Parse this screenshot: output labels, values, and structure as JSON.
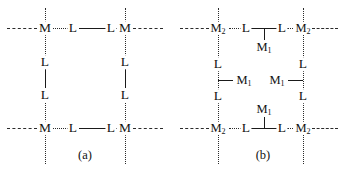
{
  "figure": {
    "name": "coordination-polymer-lattice-schemes",
    "panels": [
      {
        "id": "a",
        "caption": "(a)",
        "description": "Square grid lattice of M nodes bridged by L-L linkers",
        "node_label": "M",
        "linker_label": "L",
        "nodes": [
          {
            "label": "M",
            "position": "top-left"
          },
          {
            "label": "M",
            "position": "top-right"
          },
          {
            "label": "M",
            "position": "bottom-left"
          },
          {
            "label": "M",
            "position": "bottom-right"
          }
        ],
        "linkers": [
          {
            "label": "L",
            "position": "top-left-inner"
          },
          {
            "label": "L",
            "position": "top-right-inner"
          },
          {
            "label": "L",
            "position": "left-upper"
          },
          {
            "label": "L",
            "position": "left-lower"
          },
          {
            "label": "L",
            "position": "right-upper"
          },
          {
            "label": "L",
            "position": "right-lower"
          },
          {
            "label": "L",
            "position": "bottom-left-inner"
          },
          {
            "label": "L",
            "position": "bottom-right-inner"
          }
        ]
      },
      {
        "id": "b",
        "caption": "(b)",
        "description": "Same lattice with M2 nodes and pendant M1 centres bound to the L-L linkers",
        "primary_node_label": "M",
        "primary_node_subscript": "2",
        "secondary_node_label": "M",
        "secondary_node_subscript": "1",
        "linker_label": "L",
        "nodes": [
          {
            "label": "M",
            "sub": "2",
            "position": "top-left"
          },
          {
            "label": "M",
            "sub": "2",
            "position": "top-right"
          },
          {
            "label": "M",
            "sub": "2",
            "position": "bottom-left"
          },
          {
            "label": "M",
            "sub": "2",
            "position": "bottom-right"
          }
        ],
        "pendant_nodes": [
          {
            "label": "M",
            "sub": "1",
            "position": "top-centre-below-linker"
          },
          {
            "label": "M",
            "sub": "1",
            "position": "left-centre-right-of-linker"
          },
          {
            "label": "M",
            "sub": "1",
            "position": "right-centre-left-of-linker"
          },
          {
            "label": "M",
            "sub": "1",
            "position": "bottom-centre-above-linker"
          }
        ],
        "linkers": [
          {
            "label": "L",
            "position": "top-left-inner"
          },
          {
            "label": "L",
            "position": "top-right-inner"
          },
          {
            "label": "L",
            "position": "left-upper"
          },
          {
            "label": "L",
            "position": "left-lower"
          },
          {
            "label": "L",
            "position": "right-upper"
          },
          {
            "label": "L",
            "position": "right-lower"
          },
          {
            "label": "L",
            "position": "bottom-left-inner"
          },
          {
            "label": "L",
            "position": "bottom-right-inner"
          }
        ]
      }
    ]
  }
}
